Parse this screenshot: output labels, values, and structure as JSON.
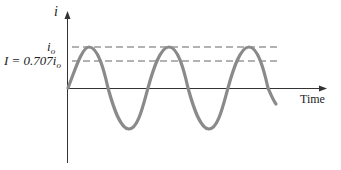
{
  "figure": {
    "type": "sinusoidal current vs time",
    "y_axis_label": "i",
    "x_axis_label": "Time",
    "peak_label_base": "i",
    "peak_label_sub": "o",
    "rms_label_prefix": "I = 0.707",
    "rms_label_var": "i",
    "rms_label_sub": "o",
    "colors": {
      "wave": "#8a8a8a",
      "axes": "#333333",
      "dashed": "#555555",
      "text": "#222222"
    },
    "cycles_shown": 2.5
  }
}
